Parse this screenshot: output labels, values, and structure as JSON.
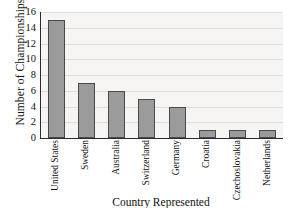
{
  "chart_data": {
    "type": "bar",
    "title": "",
    "xlabel": "Country Represented",
    "ylabel": "Number of Championships",
    "categories": [
      "United States",
      "Sweden",
      "Australia",
      "Switzerland",
      "Germany",
      "Croatia",
      "Czechoslovakia",
      "Netherlands"
    ],
    "values": [
      15,
      7,
      6,
      5,
      4,
      1,
      1,
      1
    ],
    "ylim": [
      0,
      16
    ],
    "ytick_labels": [
      "0",
      "2",
      "4",
      "6",
      "8",
      "10",
      "12",
      "14",
      "16"
    ],
    "ytick_values": [
      0,
      2,
      4,
      6,
      8,
      10,
      12,
      14,
      16
    ],
    "grid": "horizontal",
    "legend": "none",
    "colors": {
      "bar_fill": "#9b9b9b",
      "bar_border": "#4a4a4a",
      "plot_background": "#f6f5f3",
      "gridline": "#dcdcd8",
      "axis": "#2b2b2b",
      "text": "#111111",
      "figure_background": "#ffffff"
    }
  }
}
